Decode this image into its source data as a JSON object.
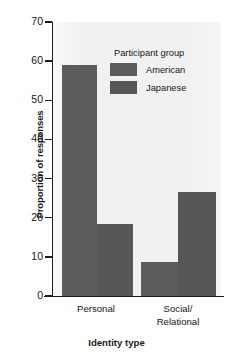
{
  "chart_data": {
    "type": "bar",
    "title": "",
    "xlabel": "Identity type",
    "ylabel": "Proportion of responses",
    "categories": [
      "Personal",
      "Social/\nRelational"
    ],
    "category_labels": [
      {
        "line1": "Personal",
        "line2": ""
      },
      {
        "line1": "Social/",
        "line2": "Relational"
      }
    ],
    "series": [
      {
        "name": "American",
        "values": [
          58.9,
          8.8
        ],
        "color": "#5c5c5c"
      },
      {
        "name": "Japanese",
        "values": [
          18.5,
          26.5
        ],
        "color": "#565656"
      }
    ],
    "ylim": [
      0,
      70
    ],
    "yticks": [
      0,
      10,
      20,
      30,
      40,
      50,
      60,
      70
    ],
    "ytick_labels": [
      "0",
      "10",
      "20",
      "30",
      "40",
      "50",
      "60",
      "70"
    ],
    "grid": false,
    "legend": {
      "title": "Participant group",
      "position": "inside-top-right",
      "entries": [
        "American",
        "Japanese"
      ]
    },
    "plot_background": "#f1f1f1",
    "axis_color": "#1d1d1d"
  }
}
